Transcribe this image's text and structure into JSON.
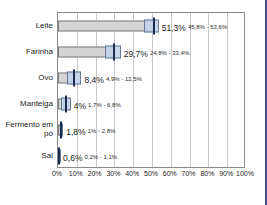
{
  "chart_data": {
    "type": "bar",
    "orientation": "horizontal",
    "title": "",
    "xlabel": "",
    "ylabel": "",
    "xlim": [
      0,
      100
    ],
    "grid": true,
    "legend": "none",
    "categories": [
      "Leite",
      "Farinha",
      "Ovo",
      "Manteiga",
      "Fermento em pó",
      "Sal"
    ],
    "values": [
      51.3,
      29.7,
      8.4,
      4.0,
      1.8,
      0.6
    ],
    "value_labels": [
      "51,3%",
      "29,7%",
      "8,4%",
      "4%",
      "1,8%",
      "0,6%"
    ],
    "ci_low": [
      45.8,
      24.8,
      4.9,
      1.7,
      1.0,
      0.2
    ],
    "ci_high": [
      53.6,
      33.4,
      12.5,
      6.8,
      2.8,
      1.1
    ],
    "ci_labels": [
      "45,8% - 53,6%",
      "24,8% - 33,4%",
      "4,9% - 12,5%",
      "1,7% - 6,8%",
      "1% - 2,8%",
      "0,2% - 1,1%"
    ],
    "xticks": [
      0,
      10,
      20,
      30,
      40,
      50,
      60,
      70,
      80,
      90,
      100
    ],
    "xtick_labels": [
      "0%",
      "10%",
      "20%",
      "30%",
      "40%",
      "50%",
      "60%",
      "70%",
      "80%",
      "90%",
      "100%"
    ]
  },
  "colors": {
    "bar_fill": "#d4d4d4",
    "bar_stroke": "#7d7d7d",
    "ci_fill": "#c3d3e8",
    "ci_stroke": "#5d6f94",
    "ci_tick": "#1b2a53",
    "gridline": "#c9c9c9",
    "frame": "#8a8a8a",
    "accent_rule": "#3a4a8c",
    "text": "#1a1a1a",
    "background": "#ffffff"
  }
}
